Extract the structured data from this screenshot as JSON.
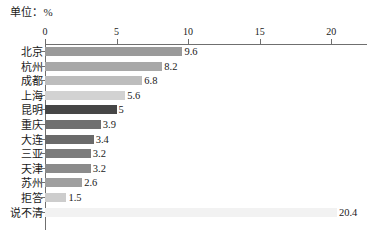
{
  "chart_data": {
    "type": "bar",
    "orientation": "horizontal",
    "title": "",
    "unit_caption": "单位：%",
    "xlabel": "",
    "ylabel": "",
    "xlim": [
      0,
      22.5
    ],
    "xticks": [
      0,
      5,
      10,
      15,
      20
    ],
    "xtick_labels": [
      "0",
      "5",
      "10",
      "15",
      "20"
    ],
    "grid": false,
    "legend": null,
    "categories": [
      "北京",
      "杭州",
      "成都",
      "上海",
      "昆明",
      "重庆",
      "大连",
      "三亚",
      "天津",
      "苏州",
      "拒答",
      "说不清"
    ],
    "values": [
      9.6,
      8.2,
      6.8,
      5.6,
      5,
      3.9,
      3.4,
      3.2,
      3.2,
      2.6,
      1.5,
      20.4
    ],
    "value_labels": [
      "9.6",
      "8.2",
      "6.8",
      "5.6",
      "5",
      "3.9",
      "3.4",
      "3.2",
      "3.2",
      "2.6",
      "1.5",
      "20.4"
    ],
    "bar_colors": [
      "#9a9a9a",
      "#a8a8a8",
      "#bdbdbd",
      "#d2d2d2",
      "#464646",
      "#707070",
      "#6a6a6a",
      "#7c7c7c",
      "#8b8b8b",
      "#9f9f9f",
      "#cdcdcd",
      "#f2f2f2"
    ],
    "axis_color": "#6f6f6f",
    "text_color": "#1a1a1a",
    "background": "#ffffff"
  }
}
